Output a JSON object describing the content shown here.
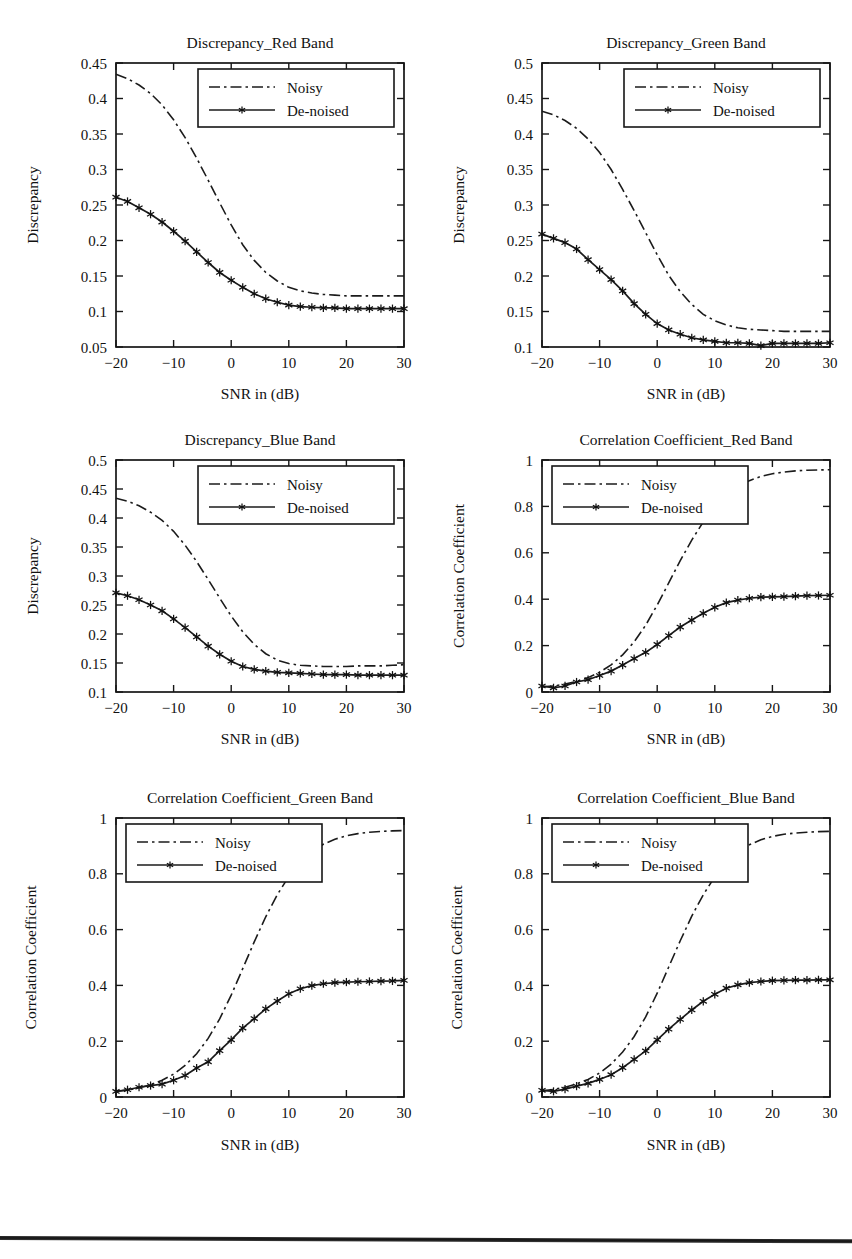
{
  "figure": {
    "background_color": "#ffffff",
    "ink_color": "#161616",
    "bottom_rule": {
      "visible": true,
      "top": 1236,
      "color": "#1a1a1a"
    }
  },
  "common": {
    "xlabel": "SNR in (dB)",
    "x_ticks": [
      -20,
      -10,
      0,
      10,
      20,
      30
    ],
    "x_tick_labels": [
      "−20",
      "−10",
      "0",
      "10",
      "20",
      "30"
    ],
    "xlim": [
      -20,
      30
    ],
    "legend_entries": [
      "Noisy",
      "De-noised"
    ],
    "legend_noisy_label": "Noisy",
    "legend_denoised_label": "De-noised",
    "x_data": [
      -20,
      -18,
      -16,
      -14,
      -12,
      -10,
      -8,
      -6,
      -4,
      -2,
      0,
      2,
      4,
      6,
      8,
      10,
      12,
      14,
      16,
      18,
      20,
      22,
      24,
      26,
      28,
      30
    ]
  },
  "chart_data": [
    {
      "id": "discrepancy-red",
      "type": "line",
      "title": "Discrepancy_Red Band",
      "xlabel": "SNR in (dB)",
      "ylabel": "Discrepancy",
      "xlim": [
        -20,
        30
      ],
      "ylim": [
        0.05,
        0.45
      ],
      "y_ticks": [
        0.05,
        0.1,
        0.15,
        0.2,
        0.25,
        0.3,
        0.35,
        0.4,
        0.45
      ],
      "y_tick_labels": [
        "0.05",
        "0.1",
        "0.15",
        "0.2",
        "0.25",
        "0.3",
        "0.35",
        "0.4",
        "0.45"
      ],
      "x_ticks": [
        -20,
        -10,
        0,
        10,
        20,
        30
      ],
      "grid": false,
      "legend_position": "top-right",
      "x": [
        -20,
        -18,
        -16,
        -14,
        -12,
        -10,
        -8,
        -6,
        -4,
        -2,
        0,
        2,
        4,
        6,
        8,
        10,
        12,
        14,
        16,
        18,
        20,
        22,
        24,
        26,
        28,
        30
      ],
      "series": [
        {
          "name": "Noisy",
          "style": "dash-dot",
          "marker": "none",
          "values": [
            0.434,
            0.428,
            0.419,
            0.407,
            0.391,
            0.37,
            0.345,
            0.316,
            0.285,
            0.253,
            0.222,
            0.194,
            0.172,
            0.155,
            0.143,
            0.134,
            0.129,
            0.126,
            0.124,
            0.123,
            0.122,
            0.122,
            0.122,
            0.122,
            0.122,
            0.122
          ]
        },
        {
          "name": "De-noised",
          "style": "solid",
          "marker": "star",
          "values": [
            0.261,
            0.255,
            0.246,
            0.237,
            0.226,
            0.213,
            0.199,
            0.184,
            0.169,
            0.155,
            0.144,
            0.134,
            0.125,
            0.118,
            0.113,
            0.109,
            0.107,
            0.106,
            0.105,
            0.105,
            0.104,
            0.104,
            0.104,
            0.104,
            0.104,
            0.104
          ]
        }
      ]
    },
    {
      "id": "discrepancy-green",
      "type": "line",
      "title": "Discrepancy_Green Band",
      "xlabel": "SNR in (dB)",
      "ylabel": "Discrepancy",
      "xlim": [
        -20,
        30
      ],
      "ylim": [
        0.1,
        0.5
      ],
      "y_ticks": [
        0.1,
        0.15,
        0.2,
        0.25,
        0.3,
        0.35,
        0.4,
        0.45,
        0.5
      ],
      "y_tick_labels": [
        "0.1",
        "0.15",
        "0.2",
        "0.25",
        "0.3",
        "0.35",
        "0.4",
        "0.45",
        "0.5"
      ],
      "x_ticks": [
        -20,
        -10,
        0,
        10,
        20,
        30
      ],
      "grid": false,
      "legend_position": "top-right",
      "x": [
        -20,
        -18,
        -16,
        -14,
        -12,
        -10,
        -8,
        -6,
        -4,
        -2,
        0,
        2,
        4,
        6,
        8,
        10,
        12,
        14,
        16,
        18,
        20,
        22,
        24,
        26,
        28,
        30
      ],
      "series": [
        {
          "name": "Noisy",
          "style": "dash-dot",
          "marker": "none",
          "values": [
            0.432,
            0.427,
            0.419,
            0.408,
            0.393,
            0.374,
            0.35,
            0.322,
            0.292,
            0.261,
            0.23,
            0.201,
            0.178,
            0.16,
            0.146,
            0.137,
            0.131,
            0.127,
            0.125,
            0.124,
            0.123,
            0.122,
            0.122,
            0.122,
            0.122,
            0.122
          ]
        },
        {
          "name": "De-noised",
          "style": "solid",
          "marker": "star",
          "values": [
            0.259,
            0.253,
            0.247,
            0.238,
            0.223,
            0.209,
            0.195,
            0.179,
            0.161,
            0.146,
            0.133,
            0.124,
            0.118,
            0.113,
            0.11,
            0.108,
            0.106,
            0.106,
            0.105,
            0.102,
            0.105,
            0.105,
            0.105,
            0.105,
            0.105,
            0.106
          ]
        }
      ]
    },
    {
      "id": "discrepancy-blue",
      "type": "line",
      "title": "Discrepancy_Blue Band",
      "xlabel": "SNR in (dB)",
      "ylabel": "Discrepancy",
      "xlim": [
        -20,
        30
      ],
      "ylim": [
        0.1,
        0.5
      ],
      "y_ticks": [
        0.1,
        0.15,
        0.2,
        0.25,
        0.3,
        0.35,
        0.4,
        0.45,
        0.5
      ],
      "y_tick_labels": [
        "0.1",
        "0.15",
        "0.2",
        "0.25",
        "0.3",
        "0.35",
        "0.4",
        "0.45",
        "0.5"
      ],
      "x_ticks": [
        -20,
        -10,
        0,
        10,
        20,
        30
      ],
      "grid": false,
      "legend_position": "top-right",
      "x": [
        -20,
        -18,
        -16,
        -14,
        -12,
        -10,
        -8,
        -6,
        -4,
        -2,
        0,
        2,
        4,
        6,
        8,
        10,
        12,
        14,
        16,
        18,
        20,
        22,
        24,
        26,
        28,
        30
      ],
      "series": [
        {
          "name": "Noisy",
          "style": "dash-dot",
          "marker": "none",
          "values": [
            0.434,
            0.429,
            0.421,
            0.41,
            0.396,
            0.377,
            0.353,
            0.325,
            0.294,
            0.262,
            0.231,
            0.204,
            0.182,
            0.166,
            0.155,
            0.149,
            0.146,
            0.145,
            0.144,
            0.144,
            0.144,
            0.145,
            0.145,
            0.145,
            0.146,
            0.147
          ]
        },
        {
          "name": "De-noised",
          "style": "solid",
          "marker": "star",
          "values": [
            0.271,
            0.266,
            0.259,
            0.25,
            0.24,
            0.226,
            0.211,
            0.195,
            0.179,
            0.165,
            0.153,
            0.144,
            0.139,
            0.136,
            0.134,
            0.133,
            0.132,
            0.131,
            0.13,
            0.13,
            0.13,
            0.129,
            0.129,
            0.129,
            0.129,
            0.129
          ]
        }
      ]
    },
    {
      "id": "correlation-red",
      "type": "line",
      "title": "Correlation Coefficient_Red Band",
      "xlabel": "SNR in (dB)",
      "ylabel": "Correlation Coefficient",
      "xlim": [
        -20,
        30
      ],
      "ylim": [
        0,
        1
      ],
      "y_ticks": [
        0,
        0.2,
        0.4,
        0.6,
        0.8,
        1
      ],
      "y_tick_labels": [
        "0",
        "0.2",
        "0.4",
        "0.6",
        "0.8",
        "1"
      ],
      "x_ticks": [
        -20,
        -10,
        0,
        10,
        20,
        30
      ],
      "grid": false,
      "legend_position": "top-left",
      "x": [
        -20,
        -18,
        -16,
        -14,
        -12,
        -10,
        -8,
        -6,
        -4,
        -2,
        0,
        2,
        4,
        6,
        8,
        10,
        12,
        14,
        16,
        18,
        20,
        22,
        24,
        26,
        28,
        30
      ],
      "series": [
        {
          "name": "Noisy",
          "style": "dash-dot",
          "marker": "none",
          "values": [
            0.022,
            0.026,
            0.034,
            0.046,
            0.062,
            0.085,
            0.117,
            0.16,
            0.216,
            0.288,
            0.375,
            0.47,
            0.566,
            0.655,
            0.733,
            0.797,
            0.847,
            0.884,
            0.911,
            0.929,
            0.941,
            0.948,
            0.953,
            0.956,
            0.957,
            0.958
          ]
        },
        {
          "name": "De-noised",
          "style": "solid",
          "marker": "star",
          "values": [
            0.026,
            0.018,
            0.026,
            0.043,
            0.053,
            0.071,
            0.09,
            0.116,
            0.144,
            0.171,
            0.205,
            0.243,
            0.28,
            0.31,
            0.339,
            0.365,
            0.385,
            0.396,
            0.404,
            0.409,
            0.41,
            0.411,
            0.413,
            0.415,
            0.416,
            0.417
          ]
        }
      ]
    },
    {
      "id": "correlation-green",
      "type": "line",
      "title": "Correlation Coefficient_Green Band",
      "xlabel": "SNR in (dB)",
      "ylabel": "Correlation Coefficient",
      "xlim": [
        -20,
        30
      ],
      "ylim": [
        0,
        1
      ],
      "y_ticks": [
        0,
        0.2,
        0.4,
        0.6,
        0.8,
        1
      ],
      "y_tick_labels": [
        "0",
        "0.2",
        "0.4",
        "0.6",
        "0.8",
        "1"
      ],
      "x_ticks": [
        -20,
        -10,
        0,
        10,
        20,
        30
      ],
      "grid": false,
      "legend_position": "top-left",
      "x": [
        -20,
        -18,
        -16,
        -14,
        -12,
        -10,
        -8,
        -6,
        -4,
        -2,
        0,
        2,
        4,
        6,
        8,
        10,
        12,
        14,
        16,
        18,
        20,
        22,
        24,
        26,
        28,
        30
      ],
      "series": [
        {
          "name": "Noisy",
          "style": "dash-dot",
          "marker": "none",
          "values": [
            0.02,
            0.025,
            0.033,
            0.044,
            0.06,
            0.082,
            0.113,
            0.155,
            0.21,
            0.28,
            0.365,
            0.46,
            0.556,
            0.646,
            0.725,
            0.79,
            0.841,
            0.878,
            0.906,
            0.924,
            0.936,
            0.944,
            0.949,
            0.952,
            0.954,
            0.955
          ]
        },
        {
          "name": "De-noised",
          "style": "solid",
          "marker": "star",
          "values": [
            0.02,
            0.026,
            0.035,
            0.041,
            0.046,
            0.06,
            0.077,
            0.104,
            0.126,
            0.166,
            0.205,
            0.247,
            0.281,
            0.316,
            0.344,
            0.37,
            0.388,
            0.399,
            0.406,
            0.41,
            0.412,
            0.413,
            0.414,
            0.415,
            0.416,
            0.418
          ]
        }
      ]
    },
    {
      "id": "correlation-blue",
      "type": "line",
      "title": "Correlation Coefficient_Blue Band",
      "xlabel": "SNR in (dB)",
      "ylabel": "Correlation Coefficient",
      "xlim": [
        -20,
        30
      ],
      "ylim": [
        0,
        1
      ],
      "y_ticks": [
        0,
        0.2,
        0.4,
        0.6,
        0.8,
        1
      ],
      "y_tick_labels": [
        "0",
        "0.2",
        "0.4",
        "0.6",
        "0.8",
        "1"
      ],
      "x_ticks": [
        -20,
        -10,
        0,
        10,
        20,
        30
      ],
      "grid": false,
      "legend_position": "top-left",
      "x": [
        -20,
        -18,
        -16,
        -14,
        -12,
        -10,
        -8,
        -6,
        -4,
        -2,
        0,
        2,
        4,
        6,
        8,
        10,
        12,
        14,
        16,
        18,
        20,
        22,
        24,
        26,
        28,
        30
      ],
      "series": [
        {
          "name": "Noisy",
          "style": "dash-dot",
          "marker": "none",
          "values": [
            0.022,
            0.027,
            0.035,
            0.047,
            0.063,
            0.086,
            0.118,
            0.161,
            0.217,
            0.287,
            0.372,
            0.466,
            0.56,
            0.648,
            0.725,
            0.789,
            0.839,
            0.877,
            0.904,
            0.922,
            0.934,
            0.942,
            0.946,
            0.949,
            0.951,
            0.952
          ]
        },
        {
          "name": "De-noised",
          "style": "solid",
          "marker": "star",
          "values": [
            0.024,
            0.02,
            0.028,
            0.039,
            0.049,
            0.063,
            0.08,
            0.105,
            0.135,
            0.165,
            0.205,
            0.243,
            0.278,
            0.312,
            0.343,
            0.368,
            0.39,
            0.402,
            0.41,
            0.414,
            0.417,
            0.418,
            0.419,
            0.419,
            0.42,
            0.42
          ]
        }
      ]
    }
  ]
}
